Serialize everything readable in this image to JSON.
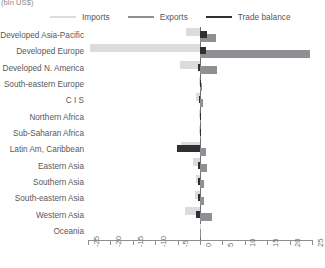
{
  "unit_label": "(bln US$)",
  "legend": {
    "items": [
      {
        "label": "Imports",
        "color": "#dcdcdc",
        "name": "legend-imports"
      },
      {
        "label": "Exports",
        "color": "#8f9093",
        "name": "legend-exports"
      },
      {
        "label": "Trade balance",
        "color": "#2f3033",
        "name": "legend-trade-balance"
      }
    ]
  },
  "chart_data": {
    "type": "bar",
    "orientation": "horizontal",
    "title": "",
    "subtitle": "",
    "xlabel": "(bln US$)",
    "ylabel": "",
    "xlim": [
      -25,
      25
    ],
    "xticks": [
      -25,
      -20,
      -15,
      -10,
      -5,
      0,
      5,
      10,
      15,
      20,
      25
    ],
    "xtick_labels": [
      "-25",
      "-20",
      "-15",
      "-10",
      "-5",
      "0",
      "5",
      "10",
      "15",
      "20",
      "25"
    ],
    "grid": false,
    "legend_position": "top",
    "zero_reference_line": 0,
    "categories": [
      "Developed Asia-Pacific",
      "Developed Europe",
      "Developed N. America",
      "South-eastern Europe",
      "C I S",
      "Northern Africa",
      "Sub-Saharan Africa",
      "Latin Am, Caribbean",
      "Eastern Asia",
      "Southern Asia",
      "South-eastern Asia",
      "Western Asia",
      "Oceania"
    ],
    "series": [
      {
        "name": "Imports",
        "color": "#dcdcdc",
        "values": [
          -3.2,
          -24.5,
          -4.5,
          -0.3,
          -0.9,
          -0.2,
          -0.3,
          -4.2,
          -1.6,
          -1.0,
          -1.2,
          -3.4,
          -0.1
        ]
      },
      {
        "name": "Exports",
        "color": "#8f9093",
        "values": [
          3.6,
          24.6,
          3.8,
          0.4,
          0.7,
          0.2,
          0.3,
          1.3,
          1.5,
          0.8,
          1.0,
          2.6,
          0.1
        ]
      },
      {
        "name": "Trade balance",
        "color": "#2f3033",
        "values": [
          1.6,
          1.4,
          -0.4,
          0.2,
          -0.3,
          0.1,
          0.1,
          -5.2,
          -0.5,
          -0.4,
          -0.5,
          -0.8,
          0.0
        ]
      }
    ]
  }
}
